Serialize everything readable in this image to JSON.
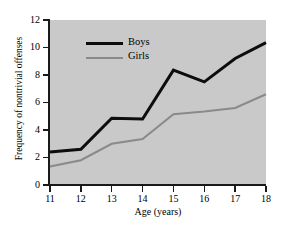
{
  "chart_data": {
    "type": "line",
    "title": "",
    "xlabel": "Age (years)",
    "ylabel": "Frequency of nontrivial offenses",
    "x": [
      11,
      12,
      13,
      14,
      15,
      16,
      17,
      18
    ],
    "xticklabels": [
      "11",
      "12",
      "13",
      "14",
      "15",
      "16",
      "17",
      "18"
    ],
    "yticklabels": [
      "0",
      "2",
      "4",
      "6",
      "8",
      "10",
      "12"
    ],
    "yticks": [
      0,
      2,
      4,
      6,
      8,
      10,
      12
    ],
    "xlim": [
      11,
      18
    ],
    "ylim": [
      0,
      12
    ],
    "grid": false,
    "legend_position": "upper-left-inside",
    "plot_background": "#c9c9c9",
    "series": [
      {
        "name": "Boys",
        "color": "#0d0d0d",
        "linewidth": 3,
        "values": [
          2.4,
          2.6,
          4.85,
          4.8,
          8.35,
          7.5,
          9.2,
          10.35
        ]
      },
      {
        "name": "Girls",
        "color": "#8a8a8a",
        "linewidth": 2,
        "values": [
          1.35,
          1.8,
          3.0,
          3.35,
          5.15,
          5.35,
          5.6,
          6.6
        ]
      }
    ]
  },
  "legend": {
    "items": [
      {
        "label": "Boys"
      },
      {
        "label": "Girls"
      }
    ]
  }
}
